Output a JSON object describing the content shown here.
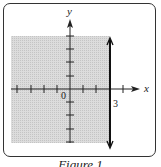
{
  "figure": {
    "caption": "Figure 1",
    "x_axis_label": "x",
    "y_axis_label": "y",
    "origin_label": "0",
    "line_label": "3"
  },
  "graph": {
    "inequality": "x < 3 (shaded region left of vertical line x = 3)",
    "boundary": {
      "type": "vertical line",
      "x": 3,
      "style": "solid"
    },
    "shaded_side": "left",
    "x_ticks": [
      -4,
      -3,
      -2,
      -1,
      1,
      2,
      3,
      4
    ],
    "y_ticks": [
      -4,
      -3,
      -2,
      -1,
      1,
      2,
      3,
      4
    ],
    "colors": {
      "shade": "#d6d6d6",
      "axis": "#222222",
      "line": "#111111"
    }
  }
}
